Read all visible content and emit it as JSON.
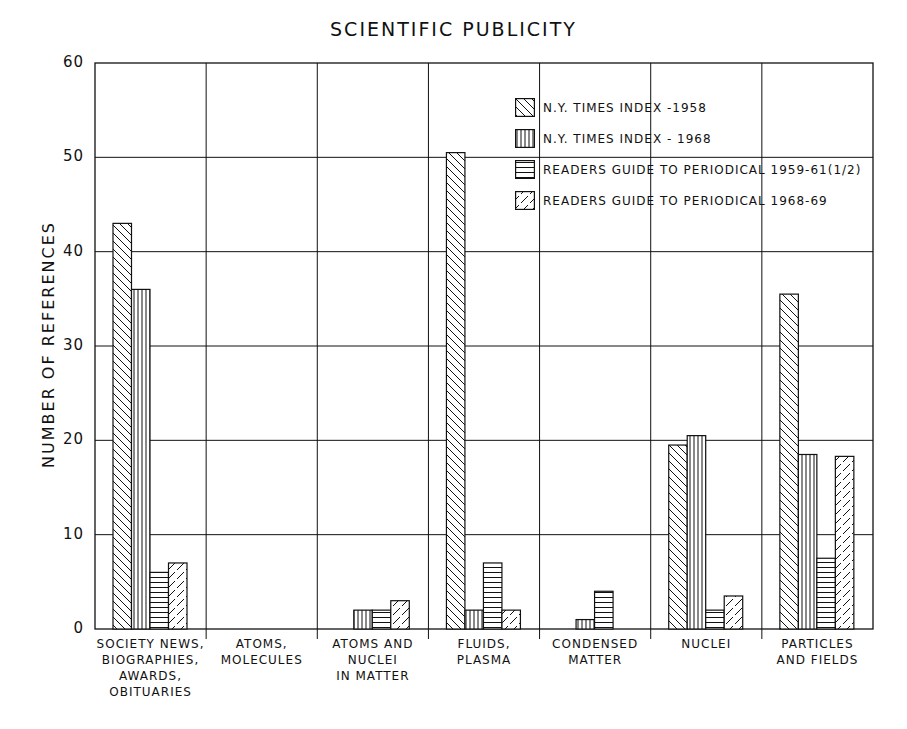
{
  "chart_data": {
    "type": "bar",
    "title": "SCIENTIFIC PUBLICITY",
    "xlabel": "",
    "ylabel": "NUMBER OF REFERENCES",
    "ylim": [
      0,
      60
    ],
    "yticks": [
      0,
      10,
      20,
      30,
      40,
      50,
      60
    ],
    "grid": true,
    "legend_position": "upper right",
    "categories": [
      "SOCIETY NEWS,\nBIOGRAPHIES,\nAWARDS,\nOBITUARIES",
      "ATOMS,\nMOLECULES",
      "ATOMS AND\nNUCLEI\nIN MATTER",
      "FLUIDS,\nPLASMA",
      "CONDENSED\nMATTER",
      "NUCLEI",
      "PARTICLES\nAND FIELDS"
    ],
    "series": [
      {
        "name": "N.Y. TIMES INDEX -1958",
        "pattern": "diagonal-back",
        "values": [
          43,
          0,
          0,
          50.5,
          0,
          19.5,
          35.5
        ]
      },
      {
        "name": "N.Y. TIMES INDEX - 1968",
        "pattern": "vertical",
        "values": [
          36,
          0,
          2,
          2,
          1,
          20.5,
          18.5
        ]
      },
      {
        "name": "READERS GUIDE TO PERIODICAL 1959-61(1/2)",
        "pattern": "horizontal",
        "values": [
          6,
          0,
          2,
          7,
          4,
          2,
          7.5
        ]
      },
      {
        "name": "READERS GUIDE TO PERIODICAL 1968-69",
        "pattern": "diagonal-dashed",
        "values": [
          7,
          0,
          3,
          2,
          0,
          3.5,
          18.3
        ]
      }
    ]
  }
}
